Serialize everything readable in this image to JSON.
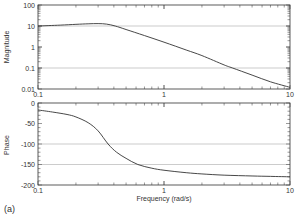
{
  "chart_data": [
    {
      "type": "line",
      "name": "magnitude",
      "title": "",
      "xlabel": "",
      "ylabel": "Magnitude",
      "xscale": "log",
      "yscale": "log",
      "xlim": [
        0.1,
        10
      ],
      "ylim": [
        0.01,
        100
      ],
      "x_ticks": [
        "0.1",
        "1",
        "10"
      ],
      "y_ticks": [
        "100",
        "10",
        "1",
        "0.1",
        "0.01"
      ],
      "y_tick_values": [
        100,
        10,
        1,
        0.1,
        0.01
      ],
      "grid_lines_y": [
        10,
        0.1
      ],
      "series": [
        {
          "name": "Magnitude",
          "x": [
            0.1,
            0.15,
            0.2,
            0.25,
            0.3,
            0.35,
            0.41,
            0.5,
            0.7,
            1,
            1.5,
            2,
            3,
            3.5,
            5,
            7,
            10
          ],
          "values": [
            10,
            11,
            12,
            12.7,
            13,
            12.3,
            10,
            6.8,
            3.5,
            1.7,
            0.72,
            0.39,
            0.14,
            0.1,
            0.046,
            0.022,
            0.012
          ]
        }
      ]
    },
    {
      "type": "line",
      "name": "phase",
      "title": "",
      "xlabel": "Frequency (rad/s)",
      "ylabel": "Phase",
      "xscale": "log",
      "yscale": "linear",
      "xlim": [
        0.1,
        10
      ],
      "ylim": [
        -200,
        0
      ],
      "x_ticks": [
        "0.1",
        "1",
        "10"
      ],
      "y_ticks": [
        "0",
        "-50",
        "-100",
        "-150",
        "-200"
      ],
      "y_tick_values": [
        0,
        -50,
        -100,
        -150,
        -200
      ],
      "grid_lines_y": [
        -100,
        -150
      ],
      "series": [
        {
          "name": "Phase",
          "x": [
            0.1,
            0.13,
            0.17,
            0.2,
            0.25,
            0.3,
            0.36,
            0.42,
            0.5,
            0.62,
            0.8,
            1,
            1.5,
            2,
            3,
            5,
            7,
            10
          ],
          "values": [
            -17,
            -22,
            -28,
            -34,
            -48,
            -68,
            -100,
            -120,
            -135,
            -150,
            -159,
            -164,
            -170,
            -173,
            -176,
            -178,
            -179,
            -180
          ]
        }
      ]
    }
  ],
  "panel_label": "(a)"
}
